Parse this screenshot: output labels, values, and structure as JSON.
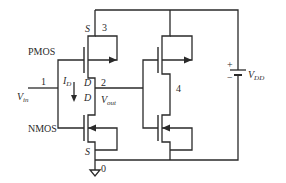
{
  "diagram": {
    "labels": {
      "pmos": "PMOS",
      "nmos": "NMOS",
      "node1": "1",
      "node2": "2",
      "node3": "3",
      "node4": "4",
      "node0": "0",
      "s_top": "S",
      "d_top": "D",
      "d_bottom": "D",
      "s_bottom": "S",
      "id_main": "I",
      "id_sub": "D",
      "vin_main": "V",
      "vin_sub": "in",
      "vout_main": "V",
      "vout_sub": "out",
      "vdd_main": "V",
      "vdd_sub": "DD",
      "plus": "+",
      "minus": "−"
    },
    "components": [
      {
        "type": "pmos",
        "name": "PMOS",
        "terminals": [
          "S",
          "D"
        ]
      },
      {
        "type": "nmos",
        "name": "NMOS",
        "terminals": [
          "D",
          "S"
        ]
      },
      {
        "type": "pmos",
        "name": "load-pmos"
      },
      {
        "type": "nmos",
        "name": "load-nmos"
      },
      {
        "type": "battery",
        "name": "VDD"
      },
      {
        "type": "ground",
        "name": "ground"
      }
    ],
    "colors": {
      "line": "#2a2a2a",
      "background": "#ffffff"
    }
  }
}
